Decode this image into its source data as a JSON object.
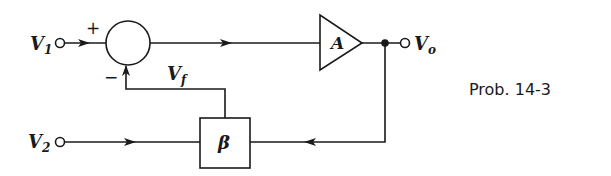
{
  "diagram": {
    "type": "block-diagram-feedback-amplifier",
    "caption": "Prob. 14-3",
    "nodes": {
      "input1": {
        "label": "V",
        "subscript": "1"
      },
      "input2": {
        "label": "V",
        "subscript": "2"
      },
      "output": {
        "label": "V",
        "subscript": "o"
      },
      "feedback_signal": {
        "label": "V",
        "subscript": "f"
      },
      "summer": {
        "plus_sign": "+",
        "minus_sign": "−"
      },
      "amplifier": {
        "label": "A"
      },
      "feedback_block": {
        "label": "β"
      }
    },
    "edges": [
      {
        "from": "V1",
        "to": "summer (+)"
      },
      {
        "from": "summer",
        "to": "amplifier A"
      },
      {
        "from": "amplifier A",
        "to": "Vo"
      },
      {
        "from": "Vo",
        "to": "β block"
      },
      {
        "from": "V2",
        "to": "β block"
      },
      {
        "from": "β block",
        "to": "summer (−)",
        "label": "Vf"
      }
    ],
    "colors": {
      "ink": "#1a1a1a",
      "background": "#ffffff"
    }
  }
}
